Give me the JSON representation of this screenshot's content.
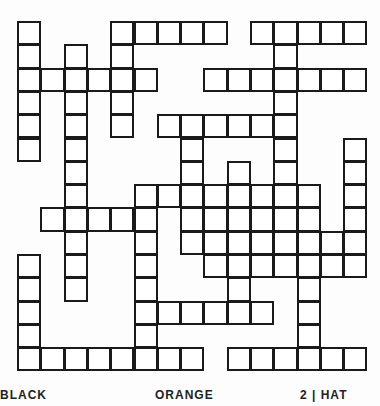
{
  "puzzle": {
    "type": "crossword",
    "rows": 15,
    "cols": 15,
    "cell_rows": [
      {
        "row": 0,
        "cols": [
          0,
          4,
          5,
          6,
          7,
          8,
          10,
          11,
          12,
          13,
          14
        ]
      },
      {
        "row": 1,
        "cols": [
          0,
          2,
          4,
          11
        ]
      },
      {
        "row": 2,
        "cols": [
          0,
          1,
          2,
          3,
          4,
          5,
          8,
          9,
          10,
          11,
          12,
          13,
          14
        ]
      },
      {
        "row": 3,
        "cols": [
          0,
          2,
          4,
          11
        ]
      },
      {
        "row": 4,
        "cols": [
          0,
          2,
          4,
          6,
          7,
          8,
          9,
          10,
          11
        ]
      },
      {
        "row": 5,
        "cols": [
          0,
          2,
          7,
          11,
          14
        ]
      },
      {
        "row": 6,
        "cols": [
          2,
          7,
          9,
          11,
          14
        ]
      },
      {
        "row": 7,
        "cols": [
          2,
          5,
          6,
          7,
          8,
          9,
          10,
          11,
          12,
          14
        ]
      },
      {
        "row": 8,
        "cols": [
          1,
          2,
          3,
          4,
          5,
          7,
          8,
          9,
          10,
          11,
          12,
          14
        ]
      },
      {
        "row": 9,
        "cols": [
          2,
          5,
          7,
          8,
          9,
          10,
          11,
          12,
          13,
          14
        ]
      },
      {
        "row": 10,
        "cols": [
          0,
          2,
          5,
          8,
          9,
          10,
          11,
          12,
          13,
          14
        ]
      },
      {
        "row": 11,
        "cols": [
          0,
          2,
          5,
          9,
          12
        ]
      },
      {
        "row": 12,
        "cols": [
          0,
          5,
          6,
          7,
          8,
          9,
          10,
          12
        ]
      },
      {
        "row": 13,
        "cols": [
          0,
          5,
          12
        ]
      },
      {
        "row": 14,
        "cols": [
          0,
          1,
          2,
          3,
          4,
          5,
          6,
          7,
          9,
          10,
          11,
          12,
          13,
          14
        ]
      }
    ],
    "cell_size_px": 23.3,
    "border_color": "#1a1a1a"
  },
  "footer": {
    "words": [
      {
        "text": "BLACK",
        "x": 0
      },
      {
        "text": "ORANGE",
        "x": 155
      },
      {
        "text": "2 | HAT",
        "x": 300
      }
    ]
  }
}
